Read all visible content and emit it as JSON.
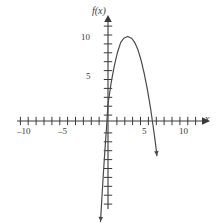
{
  "chart_data": {
    "type": "line",
    "title": "",
    "xlabel": "x",
    "ylabel": "f(x)",
    "xlim": [
      -11.5,
      11.5
    ],
    "ylim": [
      -11.5,
      11.5
    ],
    "grid": false,
    "legend": "none",
    "x_ticks_major": [
      -10,
      -5,
      5,
      10
    ],
    "x_tick_labels": [
      "-10",
      "-5",
      "5",
      "10"
    ],
    "y_ticks_major": [
      5,
      10
    ],
    "y_tick_labels": [
      "5",
      "10"
    ],
    "tick_interval": 1,
    "curve": {
      "name": "f(x)",
      "shape": "downward-parabola",
      "vertex": [
        2.5,
        9.5
      ],
      "roots": [
        -0.3,
        5.3
      ],
      "y_intercept": 4.0,
      "leading_coefficient": -1.7,
      "color": "#4a4a4a",
      "arrow_ends": "both",
      "x": [
        -0.95,
        -0.8,
        -0.6,
        -0.4,
        -0.2,
        0,
        0.4,
        0.8,
        1.2,
        1.6,
        2,
        2.5,
        3,
        3.4,
        3.8,
        4.2,
        4.6,
        5,
        5.4,
        5.8,
        6,
        6.2
      ],
      "y": [
        -11.3,
        -9.0,
        -6.1,
        -3.4,
        -0.9,
        1.9,
        4.3,
        6.2,
        7.7,
        8.8,
        9.3,
        9.5,
        9.3,
        8.8,
        8.0,
        6.8,
        5.3,
        3.5,
        1.4,
        -1.1,
        -2.4,
        -3.9
      ]
    },
    "axis_style": {
      "axis_color": "#3a3a3a",
      "background": "#ffffff",
      "arrowheads": [
        "x-positive",
        "y-positive"
      ]
    }
  },
  "labels": {
    "x_neg10": "–10",
    "x_neg5": "–5",
    "x_5": "5",
    "x_10": "10",
    "y_5": "5",
    "y_10": "10",
    "axis_x": "x",
    "axis_fx": "f(x)"
  }
}
